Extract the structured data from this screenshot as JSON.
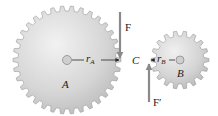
{
  "diagram": {
    "type": "gear-pair-force-diagram",
    "gears": [
      {
        "id": "A",
        "label": "A",
        "center": [
          67,
          60
        ],
        "outer_radius": 54,
        "root_radius": 49,
        "teeth": 34,
        "radius_label": "r",
        "radius_sub": "A"
      },
      {
        "id": "B",
        "label": "B",
        "center": [
          180,
          60
        ],
        "outer_radius": 29,
        "root_radius": 24,
        "teeth": 18,
        "radius_label": "r",
        "radius_sub": "B"
      }
    ],
    "contact_point": {
      "label": "C"
    },
    "forces": [
      {
        "label": "F",
        "direction": "down",
        "acts_on": "A"
      },
      {
        "label": "F′",
        "direction": "up",
        "acts_on": "B"
      }
    ],
    "colors": {
      "gear_fill": "#d8d8d8",
      "gear_edge": "#9a9a9a",
      "arrow": "#8a8a8a",
      "text": "#222222",
      "background": "#ffffff"
    }
  }
}
